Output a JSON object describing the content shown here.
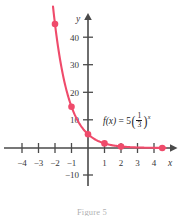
{
  "figure": {
    "caption": "Figure 5",
    "function_label": {
      "fname": "f",
      "arg": "(x)",
      "equals": "=",
      "coefficient": "5",
      "numerator": "1",
      "denominator": "3",
      "exponent": "x",
      "plain": "f(x) = 5(1/3)^x"
    },
    "axes": {
      "x_name": "x",
      "y_name": "y"
    }
  },
  "chart_data": {
    "type": "line",
    "title": "",
    "subtitle": "",
    "xlabel": "x",
    "ylabel": "y",
    "legend": [
      "f(x) = 5(1/3)^x"
    ],
    "legend_position": "inside-right",
    "grid": false,
    "xlim": [
      -4.9,
      5.0
    ],
    "ylim": [
      -13,
      50
    ],
    "x_ticks": [
      -4,
      -3,
      -2,
      -1,
      1,
      2,
      3,
      4
    ],
    "x_tick_labels": [
      "−4",
      "−3",
      "−2",
      "−1",
      "1",
      "2",
      "3",
      "4"
    ],
    "y_ticks": [
      -10,
      10,
      20,
      30,
      40
    ],
    "y_tick_labels": [
      "−10",
      "10",
      "20",
      "30",
      "40"
    ],
    "series": [
      {
        "name": "f(x) = 5(1/3)^x",
        "color": "#ef4b6b",
        "x": [
          -2,
          -1,
          0,
          1,
          2,
          4.5
        ],
        "values": [
          45,
          15,
          5,
          1.667,
          0.556,
          0.021
        ],
        "marked_points": [
          {
            "x": -2,
            "y": 45
          },
          {
            "x": -1,
            "y": 15
          },
          {
            "x": 0,
            "y": 5
          },
          {
            "x": 1,
            "y": 1.667
          },
          {
            "x": 2,
            "y": 0.556
          },
          {
            "x": 4.5,
            "y": 0.021
          }
        ]
      }
    ],
    "annotations": [
      {
        "text": "f(x) = 5(1/3)^x",
        "x": 1.0,
        "y": 9.5
      }
    ]
  }
}
